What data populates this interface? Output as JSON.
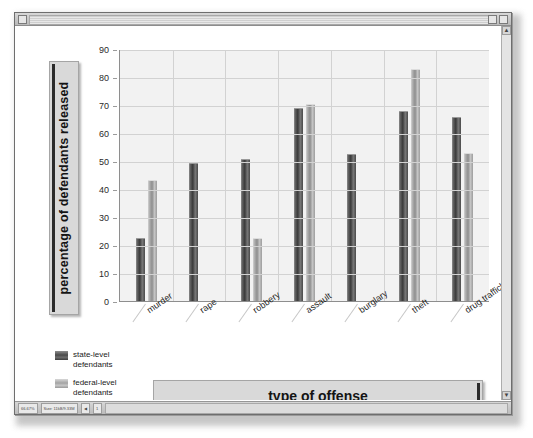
{
  "window": {
    "titlebar_left_button": "window-menu",
    "titlebar_right_buttons": [
      "restore",
      "close"
    ],
    "statusbar": {
      "cells": [
        "66.67%",
        "Size: 11kB/9.33M"
      ],
      "nav_prev": "◀",
      "nav_page": "1"
    },
    "scrollbar": {
      "up": "▲",
      "down": "▼"
    }
  },
  "chart_data": {
    "type": "bar",
    "title": "",
    "xlabel": "type of offense",
    "ylabel": "percentage of defendants released",
    "categories": [
      "murder",
      "rape",
      "robbery",
      "assault",
      "burglary",
      "theft",
      "drug trafficking"
    ],
    "series": [
      {
        "name": "state-level defendants",
        "values": [
          22,
          49,
          50.5,
          68.5,
          52,
          67.5,
          65.5
        ],
        "color": "#4a4a4a"
      },
      {
        "name": "federal-level defendants",
        "values": [
          43,
          null,
          22,
          70,
          null,
          82.5,
          52.5
        ],
        "color": "#a8a8a8"
      }
    ],
    "ylim": [
      0,
      90
    ],
    "yticks": [
      0,
      10,
      20,
      30,
      40,
      50,
      60,
      70,
      80,
      90
    ],
    "grid": true,
    "legend_position": "bottom-left",
    "plot_background": "#f2f2f2"
  },
  "legend": {
    "entries": [
      {
        "line1": "state-level",
        "line2": "defendants"
      },
      {
        "line1": "federal-level",
        "line2": "defendants"
      }
    ]
  }
}
